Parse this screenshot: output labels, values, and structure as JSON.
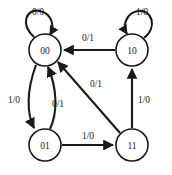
{
  "diagram": {
    "kind": "finite-state-machine",
    "title": "",
    "colors": {
      "background": "#ffffff",
      "stroke": "#1a1a1a",
      "node_fill": "#ffffff",
      "text": "#1a1a1a"
    },
    "states": [
      {
        "id": "s00",
        "label": "00",
        "cx": 45,
        "cy": 50,
        "r": 16
      },
      {
        "id": "s10",
        "label": "10",
        "cx": 132,
        "cy": 50,
        "r": 16
      },
      {
        "id": "s01",
        "label": "01",
        "cx": 45,
        "cy": 145,
        "r": 16
      },
      {
        "id": "s11",
        "label": "11",
        "cx": 132,
        "cy": 145,
        "r": 16
      }
    ],
    "transitions": [
      {
        "from": "s00",
        "to": "s00",
        "label": "0/0",
        "shape": "self-loop-top-left",
        "lx": 38,
        "ly": 12
      },
      {
        "from": "s10",
        "to": "s10",
        "label": "1/0",
        "shape": "self-loop-top-right",
        "lx": 142,
        "ly": 12
      },
      {
        "from": "s10",
        "to": "s00",
        "label": "0/1",
        "shape": "straight-top",
        "lx": 88,
        "ly": 38
      },
      {
        "from": "s00",
        "to": "s01",
        "label": "1/0",
        "shape": "curve-left-down",
        "lx": 14,
        "ly": 100
      },
      {
        "from": "s01",
        "to": "s00",
        "label": "0/1",
        "shape": "curve-right-up",
        "lx": 57,
        "ly": 104
      },
      {
        "from": "s01",
        "to": "s11",
        "label": "1/0",
        "shape": "straight-bottom",
        "lx": 88,
        "ly": 136
      },
      {
        "from": "s11",
        "to": "s00",
        "label": "0/1",
        "shape": "diagonal",
        "lx": 96,
        "ly": 84
      },
      {
        "from": "s11",
        "to": "s10",
        "label": "1/0",
        "shape": "straight-right",
        "lx": 143,
        "ly": 100
      }
    ]
  }
}
